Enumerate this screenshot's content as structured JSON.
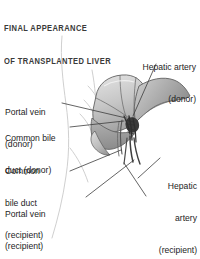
{
  "figure": {
    "title_line1": "FINAL APPEARANCE",
    "title_line2": "OF TRANSPLANTED LIVER",
    "title_color": "#3a3a3a",
    "background_color": "#ffffff",
    "illustration": {
      "subject": "transplanted liver with vascular and biliary anastomoses",
      "style": "grayscale medical line illustration",
      "organ_fill_light": "#d6d6d6",
      "organ_fill_mid": "#b9b9b9",
      "organ_fill_dark": "#8f8f8f",
      "outline_color": "#4a4a4a",
      "vessel_dark": "#2e2e2e",
      "body_outline_color": "#c9c9c9"
    },
    "labels": [
      {
        "id": "hepatic-artery-donor",
        "line1": "Hepatic artery",
        "line2": "(donor)",
        "align": "right"
      },
      {
        "id": "portal-vein-donor",
        "line1": "Portal vein",
        "line2": "(donor)",
        "align": "left"
      },
      {
        "id": "common-bile-duct-donor",
        "line1": "Common bile",
        "line2": "duct (donor)",
        "align": "left"
      },
      {
        "id": "common-bile-duct-recipient",
        "line1": "Common",
        "line2": "bile duct",
        "line3": "(recipient)",
        "align": "left"
      },
      {
        "id": "portal-vein-recipient",
        "line1": "Portal vein",
        "line2": "(recipient)",
        "align": "left"
      },
      {
        "id": "hepatic-artery-recipient",
        "line1": "Hepatic",
        "line2": "artery",
        "line3": "(recipient)",
        "align": "right"
      }
    ]
  }
}
